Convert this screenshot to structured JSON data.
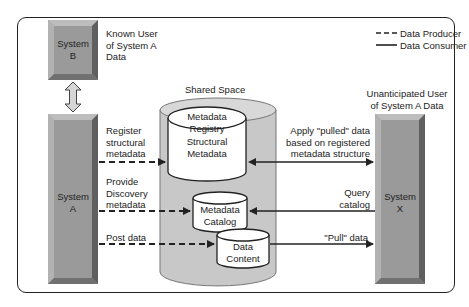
{
  "legend": {
    "producer": "Data Producer",
    "consumer": "Data Consumer"
  },
  "systems": {
    "b": {
      "line1": "System",
      "line2": "B",
      "caption": [
        "Known User",
        "of System A",
        "Data"
      ]
    },
    "a": {
      "line1": "System",
      "line2": "A"
    },
    "x": {
      "line1": "System",
      "line2": "X",
      "caption": [
        "Unanticipated User",
        "of System A Data"
      ]
    }
  },
  "shared_space": {
    "title": "Shared Space",
    "registry": [
      "Metadata",
      "Registry"
    ],
    "structural": [
      "Structural",
      "Metadata"
    ],
    "catalog": [
      "Metadata",
      "Catalog"
    ],
    "content": [
      "Data",
      "Content"
    ]
  },
  "flows": {
    "register": [
      "Register",
      "structural",
      "metadata"
    ],
    "discovery": [
      "Provide",
      "Discovery",
      "metadata"
    ],
    "post": "Post data",
    "apply": [
      "Apply \"pulled\" data",
      "based on registered",
      "metadata structure"
    ],
    "query": [
      "Query",
      "catalog"
    ],
    "pull": "\"Pull\" data"
  },
  "colors": {
    "system_fill": "#9c9c9c",
    "cylinder_fill": "#c8c8c8",
    "legend_fill": "#dcdcdc",
    "line": "#222222"
  }
}
